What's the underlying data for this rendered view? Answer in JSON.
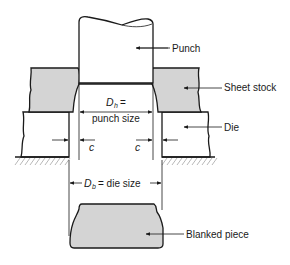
{
  "diagram": {
    "labels": {
      "punch": "Punch",
      "sheet_stock": "Sheet stock",
      "die": "Die",
      "blanked_piece": "Blanked piece"
    },
    "dimensions": {
      "punch_symbol": "D",
      "punch_subscript": "h",
      "punch_equals": "=",
      "punch_text": "punch size",
      "die_symbol": "D",
      "die_subscript": "b",
      "die_text": "= die size",
      "clearance_left": "c",
      "clearance_right": "c"
    },
    "colors": {
      "stock_fill": "#d4d4d4",
      "line": "#1a1a1a"
    }
  }
}
